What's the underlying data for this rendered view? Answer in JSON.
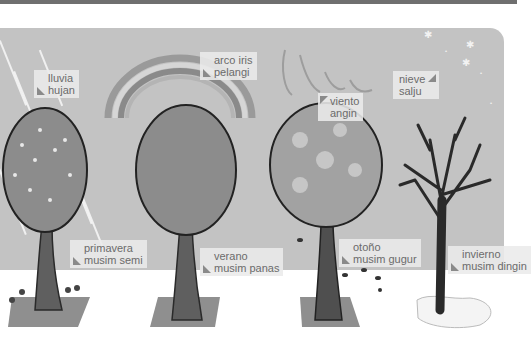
{
  "scene": {
    "title": "Seasons and weather vocabulary illustration",
    "background_sky": "#c3c3c3",
    "ground": "#ffffff"
  },
  "labels": {
    "rain": {
      "es": "lluvia",
      "ms": "hujan"
    },
    "rainbow": {
      "es": "arco iris",
      "ms": "pelangi"
    },
    "wind": {
      "es": "viento",
      "ms": "angin"
    },
    "snow": {
      "es": "nieve",
      "ms": "salju"
    },
    "spring": {
      "es": "primavera",
      "ms": "musim semi"
    },
    "summer": {
      "es": "verano",
      "ms": "musim panas"
    },
    "autumn": {
      "es": "otoño",
      "ms": "musim gugur"
    },
    "winter": {
      "es": "invierno",
      "ms": "musim dingin"
    }
  },
  "trees": [
    {
      "season": "spring",
      "icon": "blossom-tree"
    },
    {
      "season": "summer",
      "icon": "leafy-tree"
    },
    {
      "season": "autumn",
      "icon": "autumn-tree"
    },
    {
      "season": "winter",
      "icon": "bare-tree"
    }
  ]
}
